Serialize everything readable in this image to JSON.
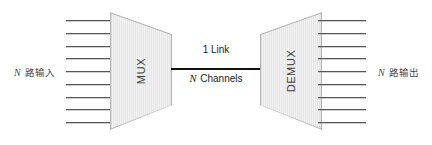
{
  "diagram": {
    "canvas": {
      "width": 432,
      "height": 145,
      "background": "#ffffff"
    },
    "colors": {
      "block_fill": "#ededed",
      "block_stroke": "#b4b4b4",
      "wire": "#555555",
      "link_line": "#121212",
      "label_text": "#1a1a1a",
      "side_label_text": "#4a4a4a"
    },
    "labels": {
      "input_side": {
        "var": "N",
        "text": " 路输入"
      },
      "output_side": {
        "var": "N",
        "text": " 路输出"
      },
      "link_top": "1 Link",
      "link_bottom": {
        "var": "N",
        "text": " Channels"
      }
    },
    "blocks": [
      {
        "id": "mux",
        "caption": "MUX",
        "shape": "trapezoid-right"
      },
      {
        "id": "demux",
        "caption": "DEMUX",
        "shape": "trapezoid-left"
      }
    ],
    "bundles": {
      "input": {
        "count": 9,
        "label": "N 路输入"
      },
      "output": {
        "count": 9,
        "label": "N 路输出"
      }
    },
    "link": {
      "count": 1,
      "label": "1 Link",
      "channels": "N Channels"
    }
  }
}
